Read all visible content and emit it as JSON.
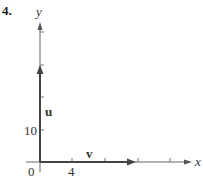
{
  "problem_number": "4.",
  "axes": {
    "x_label": "x",
    "y_label": "y",
    "origin_label": "0",
    "x_tick_label": "4",
    "y_tick_label": "10"
  },
  "vectors": [
    {
      "name": "u",
      "label": "u",
      "components": [
        0,
        30
      ]
    },
    {
      "name": "v",
      "label": "v",
      "components": [
        12,
        0
      ]
    }
  ],
  "colors": {
    "axis": "#555555",
    "vector": "#444444",
    "text": "#333333"
  }
}
